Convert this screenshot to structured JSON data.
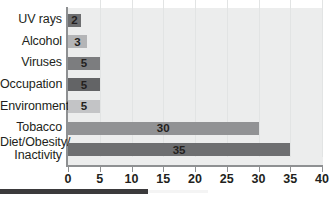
{
  "chart_data": {
    "type": "bar",
    "orientation": "horizontal",
    "title": "",
    "subtitle": "",
    "xlabel": "",
    "ylabel": "",
    "categories": [
      "UV rays",
      "Alcohol",
      "Viruses",
      "Occupation",
      "Environmental",
      "Tobacco",
      "Diet/Obesity/ Inactivity"
    ],
    "category_lines": [
      [
        "UV rays"
      ],
      [
        "Alcohol"
      ],
      [
        "Viruses"
      ],
      [
        "Occupation"
      ],
      [
        "Environmental"
      ],
      [
        "Tobacco"
      ],
      [
        "Diet/Obesity/",
        "Inactivity"
      ]
    ],
    "values": [
      2,
      3,
      5,
      5,
      5,
      30,
      35
    ],
    "value_labels": [
      "2",
      "3",
      "5",
      "5",
      "5",
      "30",
      "35"
    ],
    "bar_colors": [
      "#6d6e70",
      "#b4b5b7",
      "#7c7d7f",
      "#636466",
      "#c3c4c6",
      "#919294",
      "#6e6f71"
    ],
    "xlim": [
      0,
      40
    ],
    "xticks": [
      0,
      5,
      10,
      15,
      20,
      25,
      30,
      35,
      40
    ],
    "xtick_labels": [
      "0",
      "5",
      "10",
      "15",
      "20",
      "25",
      "30",
      "35",
      "40"
    ],
    "grid": "vertical-faint",
    "legend": "none",
    "plot_background": "#eceded",
    "axis_color": "#8e9092",
    "text_color": "#231f20"
  }
}
